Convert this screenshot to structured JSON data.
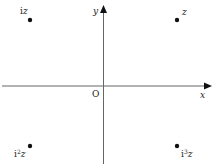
{
  "diagram": {
    "axes": {
      "x_label": "x",
      "y_label": "y",
      "origin_label": "O",
      "axis_color": "#555555"
    },
    "points": [
      {
        "id": "z",
        "label_base": "z",
        "label_prefix": "",
        "label_exp": "",
        "quadrant": "I"
      },
      {
        "id": "iz",
        "label_base": "z",
        "label_prefix": "i",
        "label_exp": "",
        "quadrant": "II"
      },
      {
        "id": "i2z",
        "label_base": "z",
        "label_prefix": "i",
        "label_exp": "2",
        "quadrant": "III"
      },
      {
        "id": "i3z",
        "label_base": "z",
        "label_prefix": "i",
        "label_exp": "3",
        "quadrant": "IV"
      }
    ],
    "point_color": "#111111"
  }
}
